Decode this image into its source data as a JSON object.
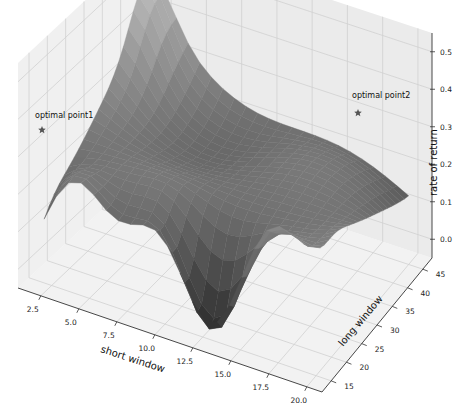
{
  "chart_data": {
    "type": "surface3d",
    "title": "",
    "xlabel": "short window",
    "ylabel": "long window",
    "zlabel": "rate of return",
    "xlim": [
      1,
      21
    ],
    "ylim": [
      12,
      48
    ],
    "zlim": [
      -0.05,
      0.55
    ],
    "x_ticks": [
      "2.5",
      "5.0",
      "7.5",
      "10.0",
      "12.5",
      "15.0",
      "17.5",
      "20.0"
    ],
    "x_tick_values": [
      2.5,
      5.0,
      7.5,
      10.0,
      12.5,
      15.0,
      17.5,
      20.0
    ],
    "y_ticks": [
      "15",
      "20",
      "25",
      "30",
      "35",
      "40",
      "45"
    ],
    "y_tick_values": [
      15,
      20,
      25,
      30,
      35,
      40,
      45
    ],
    "z_ticks": [
      "0.0",
      "0.1",
      "0.2",
      "0.3",
      "0.4",
      "0.5"
    ],
    "z_tick_values": [
      0.0,
      0.1,
      0.2,
      0.3,
      0.4,
      0.5
    ],
    "grid": true,
    "colormap": "gray",
    "surface_description": "Bowl-shaped return surface over short window (2-20) and long window (15-45); high edges along short window ~2 and long window ~45, deep jagged trough near short window 10-16 and long window 15-20 (values fall below 0).",
    "annotations": [
      {
        "label": "optimal point1",
        "marker": "star",
        "x": 2,
        "y": 45,
        "z": 0.38
      },
      {
        "label": "optimal point2",
        "marker": "star",
        "x": 20,
        "y": 15,
        "z": 0.46
      }
    ]
  }
}
